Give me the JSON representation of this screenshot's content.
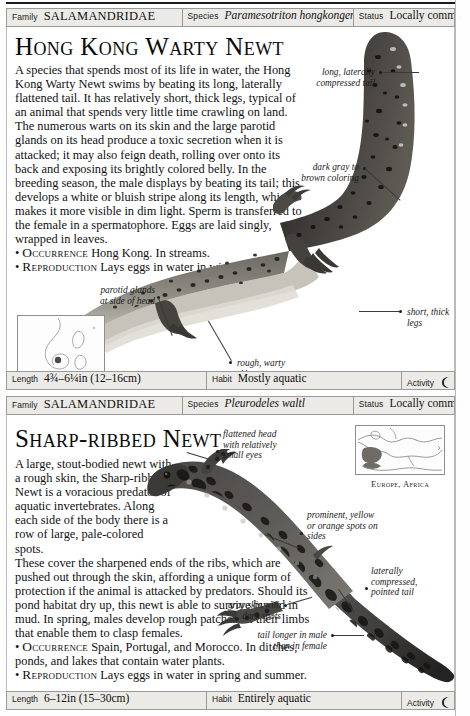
{
  "page": {
    "labels": {
      "family": "Family",
      "species": "Species",
      "status": "Status",
      "length": "Length",
      "habit": "Habit",
      "activity": "Activity"
    },
    "activity_icon": "crescent-moon-icon"
  },
  "entries": [
    {
      "family": "SALAMANDRIDAE",
      "species": "Paramesotriton hongkongensis",
      "status": "Locally common",
      "title": "Hong Kong Warty Newt",
      "description": "A species that spends most of its life in water, the Hong Kong Warty Newt swims by beating its long, laterally flattened tail. It has relatively short, thick legs, typical of an animal that spends very little time crawling on land. The numerous warts on its skin and the large parotid glands on its head produce a toxic secretion when it is attacked; it may also feign death, rolling over onto its back and exposing its brightly colored belly. In the breeding season, the male displays by beating its tail; this develops a white or bluish stripe along its length, which makes it more visible in dim light. Sperm is transferred to the female in a spermatophore. Eggs are laid singly, wrapped in leaves.",
      "occurrence_keyword": "Occurrence",
      "occurrence_text": "Hong Kong. In streams.",
      "reproduction_keyword": "Reproduction",
      "reproduction_text": "Lays eggs in water in winter.",
      "annotations": [
        "long, laterally\ncompressed tail",
        "dark gray to\nbrown coloring",
        "parotid glands\nat side of head",
        "rough, warty\nskin",
        "short, thick\nlegs"
      ],
      "map_caption": "Hong Kong",
      "length": "4¾–6¼in (12–16cm)",
      "habit": "Mostly aquatic",
      "activity": ""
    },
    {
      "family": "SALAMANDRIDAE",
      "species": "Pleurodeles waltl",
      "status": "Locally common",
      "title": "Sharp-ribbed Newt",
      "description_narrow": "A large, stout-bodied newt with a rough skin, the Sharp-ribbed Newt is a voracious predator of aquatic invertebrates. Along each side of the body there is a row of large, pale-colored spots.",
      "description_wide": "These cover the sharpened ends of the ribs, which are pushed out through the skin, affording a unique form of protection if the animal is attacked by predators. Should its pond habitat dry up, this newt is able to survive buried in mud. In spring, males develop rough patches on their limbs that enable them to clasp females.",
      "occurrence_keyword": "Occurrence",
      "occurrence_text": "Spain, Portugal, and Morocco. In ditches, ponds, and lakes that contain water plants.",
      "reproduction_keyword": "Reproduction",
      "reproduction_text": "Lays eggs in water in spring and summer.",
      "annotations": [
        "flattened head\nwith relatively\nsmall eyes",
        "prominent, yellow\nor orange spots on\nsides",
        "laterally\ncompressed,\npointed tail",
        "gray skin with\ndark spots",
        "tail longer in male\nthan in female"
      ],
      "map_caption": "Europe, Africa",
      "length": "6–12in (15–30cm)",
      "habit": "Entirely aquatic",
      "activity": ""
    }
  ]
}
